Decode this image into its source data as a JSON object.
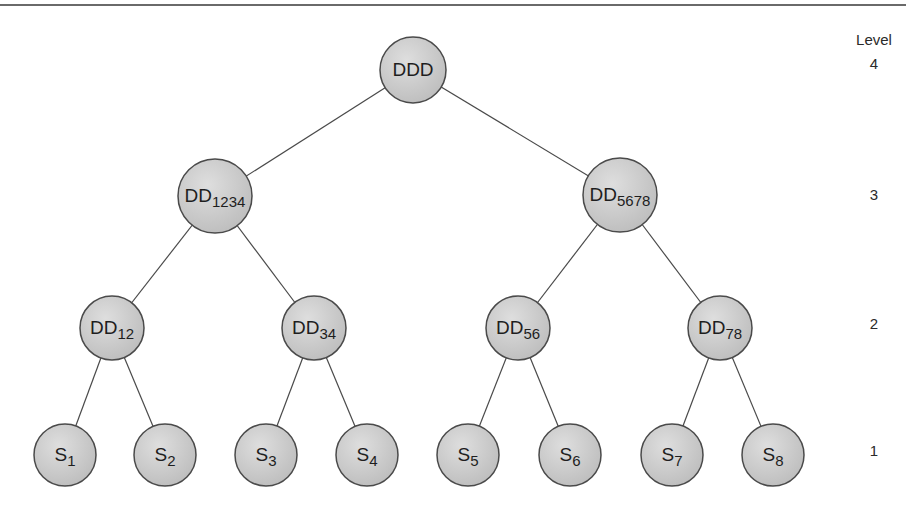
{
  "diagram": {
    "type": "binary-tree",
    "colors": {
      "node_fill": "#cfcfcf",
      "node_stroke": "#4a4a4a",
      "edge": "#4a4a4a",
      "text": "#1e1e1e"
    },
    "level_header": "Level",
    "levels": [
      {
        "id": "4",
        "label": "4",
        "y": 70
      },
      {
        "id": "3",
        "label": "3",
        "y": 196
      },
      {
        "id": "2",
        "label": "2",
        "y": 325
      },
      {
        "id": "1",
        "label": "1",
        "y": 452
      }
    ],
    "nodes": [
      {
        "id": "DDD",
        "base": "DDD",
        "sub": "",
        "x": 413,
        "y": 70,
        "r": 33,
        "level": 4
      },
      {
        "id": "DD1234",
        "base": "DD",
        "sub": "1234",
        "x": 215,
        "y": 196,
        "r": 37,
        "level": 3
      },
      {
        "id": "DD5678",
        "base": "DD",
        "sub": "5678",
        "x": 620,
        "y": 195,
        "r": 37,
        "level": 3
      },
      {
        "id": "DD12",
        "base": "DD",
        "sub": "12",
        "x": 112,
        "y": 328,
        "r": 32,
        "level": 2
      },
      {
        "id": "DD34",
        "base": "DD",
        "sub": "34",
        "x": 314,
        "y": 328,
        "r": 32,
        "level": 2
      },
      {
        "id": "DD56",
        "base": "DD",
        "sub": "56",
        "x": 518,
        "y": 328,
        "r": 32,
        "level": 2
      },
      {
        "id": "DD78",
        "base": "DD",
        "sub": "78",
        "x": 720,
        "y": 328,
        "r": 32,
        "level": 2
      },
      {
        "id": "S1",
        "base": "S",
        "sub": "1",
        "x": 65,
        "y": 455,
        "r": 31,
        "level": 1
      },
      {
        "id": "S2",
        "base": "S",
        "sub": "2",
        "x": 165,
        "y": 455,
        "r": 31,
        "level": 1
      },
      {
        "id": "S3",
        "base": "S",
        "sub": "3",
        "x": 266,
        "y": 455,
        "r": 31,
        "level": 1
      },
      {
        "id": "S4",
        "base": "S",
        "sub": "4",
        "x": 367,
        "y": 455,
        "r": 31,
        "level": 1
      },
      {
        "id": "S5",
        "base": "S",
        "sub": "5",
        "x": 468,
        "y": 455,
        "r": 31,
        "level": 1
      },
      {
        "id": "S6",
        "base": "S",
        "sub": "6",
        "x": 570,
        "y": 455,
        "r": 31,
        "level": 1
      },
      {
        "id": "S7",
        "base": "S",
        "sub": "7",
        "x": 672,
        "y": 455,
        "r": 31,
        "level": 1
      },
      {
        "id": "S8",
        "base": "S",
        "sub": "8",
        "x": 773,
        "y": 455,
        "r": 31,
        "level": 1
      }
    ],
    "edges": [
      [
        "DDD",
        "DD1234"
      ],
      [
        "DDD",
        "DD5678"
      ],
      [
        "DD1234",
        "DD12"
      ],
      [
        "DD1234",
        "DD34"
      ],
      [
        "DD5678",
        "DD56"
      ],
      [
        "DD5678",
        "DD78"
      ],
      [
        "DD12",
        "S1"
      ],
      [
        "DD12",
        "S2"
      ],
      [
        "DD34",
        "S3"
      ],
      [
        "DD34",
        "S4"
      ],
      [
        "DD56",
        "S5"
      ],
      [
        "DD56",
        "S6"
      ],
      [
        "DD78",
        "S7"
      ],
      [
        "DD78",
        "S8"
      ]
    ]
  }
}
